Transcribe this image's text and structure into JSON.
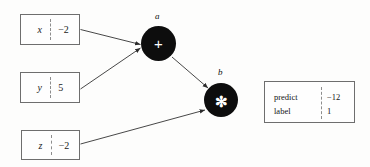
{
  "figure": {
    "type": "computational-graph",
    "background_color": "#fdfdfc",
    "node_color": "#0d0d0d",
    "edge_color": "#333333",
    "box_border_color": "#6e6e6e"
  },
  "variables": [
    {
      "name": "x",
      "value": "−2",
      "divider": "dashed"
    },
    {
      "name": "y",
      "value": "5",
      "divider": "dashed"
    },
    {
      "name": "z",
      "value": "−2",
      "divider": "dashed"
    }
  ],
  "nodes": [
    {
      "id": "a",
      "label": "a",
      "operator": "+",
      "operator_name": "plus-operator"
    },
    {
      "id": "b",
      "label": "b",
      "operator": "✻",
      "operator_name": "multiply-operator"
    }
  ],
  "edges": [
    {
      "from": "x",
      "to": "a"
    },
    {
      "from": "y",
      "to": "a"
    },
    {
      "from": "a",
      "to": "b"
    },
    {
      "from": "z",
      "to": "b"
    }
  ],
  "result": {
    "rows": [
      {
        "key": "predict",
        "value": "−12"
      },
      {
        "key": "label",
        "value": "1"
      }
    ],
    "divider": "dashed"
  }
}
